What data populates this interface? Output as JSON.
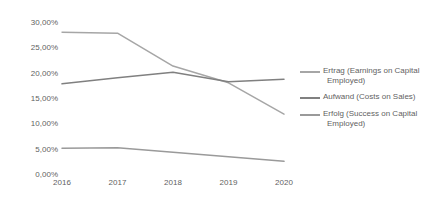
{
  "chart_data": {
    "type": "line",
    "title": "",
    "xlabel": "",
    "ylabel": "",
    "categories": [
      "2016",
      "2017",
      "2018",
      "2019",
      "2020"
    ],
    "ylim": [
      0,
      30
    ],
    "ytick_values": [
      30,
      25,
      20,
      15,
      10,
      5,
      0
    ],
    "ytick_labels": [
      "30,00%",
      "25,00%",
      "20,00%",
      "15,00%",
      "10,00%",
      "5,00%",
      "0,00%"
    ],
    "grid": false,
    "legend_position": "right",
    "series": [
      {
        "name": "Ertrag (Earnings on Capital Employed)",
        "name_line1": "Ertrag (Earnings on Capital",
        "name_line2": "Employed)",
        "color": "#a6a6a6",
        "values": [
          28.0,
          27.8,
          21.3,
          18.0,
          11.8
        ]
      },
      {
        "name": "Aufwand (Costs on Sales)",
        "name_line1": "Aufwand (Costs on Sales)",
        "name_line2": "",
        "color": "#808080",
        "values": [
          17.8,
          19.0,
          20.1,
          18.2,
          18.7
        ]
      },
      {
        "name": "Erfolg (Success on Capital Employed)",
        "name_line1": "Erfolg (Success on Capital",
        "name_line2": "Employed)",
        "color": "#9a9a9a",
        "values": [
          5.1,
          5.2,
          4.3,
          3.4,
          2.5
        ]
      }
    ]
  }
}
